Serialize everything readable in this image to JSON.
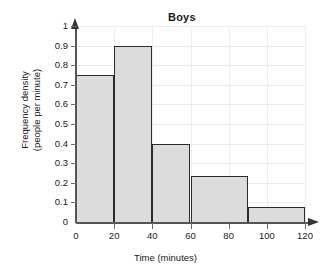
{
  "chart_data": {
    "type": "bar",
    "title": "Boys",
    "xlabel": "Time (minutes)",
    "ylabel_line1": "Frequency density",
    "ylabel_line2": "(people per minute)",
    "xlim": [
      0,
      120
    ],
    "ylim": [
      0,
      1
    ],
    "grid": true,
    "legend": "none",
    "xticks": [
      0,
      20,
      40,
      60,
      80,
      100,
      120
    ],
    "xtick_labels": [
      "0",
      "20",
      "40",
      "60",
      "80",
      "100",
      "120"
    ],
    "yticks": [
      0,
      0.1,
      0.2,
      0.3,
      0.4,
      0.5,
      0.6,
      0.7,
      0.8,
      0.9,
      1
    ],
    "ytick_labels": [
      "0",
      "0.1",
      "0.2",
      "0.3",
      "0.4",
      "0.5",
      "0.6",
      "0.7",
      "0.8",
      "0.9",
      "1"
    ],
    "bin_edges": [
      0,
      20,
      40,
      60,
      90,
      120
    ],
    "values": [
      0.75,
      0.9,
      0.4,
      0.235,
      0.075
    ],
    "bars": [
      {
        "label": "0-20",
        "x0": 0,
        "x1": 20,
        "height": 0.75
      },
      {
        "label": "20-40",
        "x0": 20,
        "x1": 40,
        "height": 0.9
      },
      {
        "label": "40-60",
        "x0": 40,
        "x1": 60,
        "height": 0.4
      },
      {
        "label": "60-90",
        "x0": 60,
        "x1": 90,
        "height": 0.235
      },
      {
        "label": "90-120",
        "x0": 90,
        "x1": 120,
        "height": 0.075
      }
    ],
    "colors": {
      "bar_fill": "#dcdcdc",
      "bar_stroke": "#2b2b2b",
      "axis": "#555558",
      "grid": "#ececed",
      "text": "#1a1a1a",
      "background": "#ffffff"
    }
  }
}
